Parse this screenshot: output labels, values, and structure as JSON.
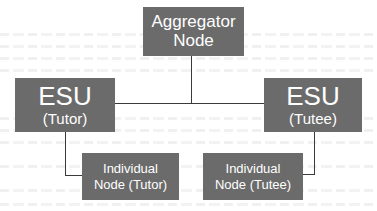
{
  "diagram": {
    "type": "hierarchy",
    "colors": {
      "box_fill": "#6b6b6b",
      "box_text": "#ffffff",
      "connector": "#3a3a3a",
      "background": "#ffffff"
    },
    "nodes": {
      "aggregator": {
        "line1": "Aggregator",
        "line2": "Node"
      },
      "esu_tutor": {
        "title": "ESU",
        "subtitle": "(Tutor)"
      },
      "esu_tutee": {
        "title": "ESU",
        "subtitle": "(Tutee)"
      },
      "individual_tutor": {
        "line1": "Individual",
        "line2": "Node (Tutor)"
      },
      "individual_tutee": {
        "line1": "Individual",
        "line2": "Node (Tutee)"
      }
    },
    "edges": [
      {
        "from": "Aggregator Node",
        "to": "ESU (Tutor)"
      },
      {
        "from": "Aggregator Node",
        "to": "ESU (Tutee)"
      },
      {
        "from": "ESU (Tutor)",
        "to": "Individual Node (Tutor)"
      },
      {
        "from": "ESU (Tutee)",
        "to": "Individual Node (Tutee)"
      }
    ]
  }
}
